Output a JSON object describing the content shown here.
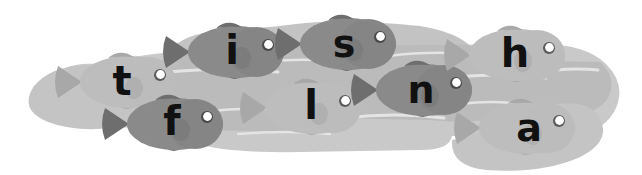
{
  "scene": {
    "title": "Fish in a pond spelling letters",
    "background_color": "#ffffff",
    "water": {
      "name": "pond",
      "fill_light": "#c9c9c9",
      "fill_dark": "#b3b3b3",
      "ripple_color": "#e6e6e6"
    },
    "word": "tisflnha",
    "letter_color": "#111111",
    "fish_dark_body": "#8a8a8a",
    "fish_dark_fin": "#6e6e6e",
    "fish_light_body": "#bdbdbd",
    "fish_light_fin": "#a8a8a8",
    "eye_color": "#ffffff",
    "eye_ring_color": "#4a4a4a"
  },
  "fish": [
    {
      "id": "fish-t",
      "letter": "t",
      "tone": "light",
      "cx": 128,
      "cy": 82,
      "scale": 1.0,
      "letter_x": 122,
      "letter_y": 84,
      "font_size": 40
    },
    {
      "id": "fish-i",
      "letter": "i",
      "tone": "dark",
      "cx": 236,
      "cy": 52,
      "scale": 1.0,
      "letter_x": 232,
      "letter_y": 53,
      "font_size": 40
    },
    {
      "id": "fish-s",
      "letter": "s",
      "tone": "dark",
      "cx": 348,
      "cy": 44,
      "scale": 1.0,
      "letter_x": 344,
      "letter_y": 46,
      "font_size": 38
    },
    {
      "id": "fish-f",
      "letter": "f",
      "tone": "dark",
      "cx": 175,
      "cy": 124,
      "scale": 1.0,
      "letter_x": 172,
      "letter_y": 124,
      "font_size": 40
    },
    {
      "id": "fish-l",
      "letter": "l",
      "tone": "light",
      "cx": 313,
      "cy": 108,
      "scale": 1.0,
      "letter_x": 311,
      "letter_y": 108,
      "font_size": 40
    },
    {
      "id": "fish-n",
      "letter": "n",
      "tone": "dark",
      "cx": 424,
      "cy": 90,
      "scale": 1.0,
      "letter_x": 421,
      "letter_y": 92,
      "font_size": 38
    },
    {
      "id": "fish-h",
      "letter": "h",
      "tone": "light",
      "cx": 517,
      "cy": 55,
      "scale": 1.0,
      "letter_x": 515,
      "letter_y": 56,
      "font_size": 40
    },
    {
      "id": "fish-a",
      "letter": "a",
      "tone": "light",
      "cx": 527,
      "cy": 128,
      "scale": 1.0,
      "letter_x": 529,
      "letter_y": 130,
      "font_size": 38
    }
  ]
}
